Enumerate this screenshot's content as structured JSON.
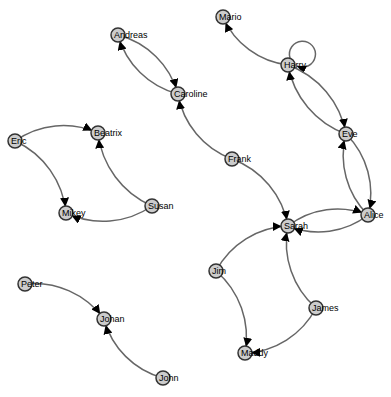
{
  "graph": {
    "type": "directed-force-graph",
    "colors": {
      "node_fill": "#cccccc",
      "node_stroke": "#333333",
      "link": "#666666",
      "arrow": "#000000",
      "background": "#ffffff"
    },
    "nodes": [
      {
        "id": "Mario",
        "x": 223,
        "y": 17
      },
      {
        "id": "Andreas",
        "x": 118,
        "y": 35
      },
      {
        "id": "Harry",
        "x": 288,
        "y": 65
      },
      {
        "id": "Caroline",
        "x": 178,
        "y": 94
      },
      {
        "id": "Eric",
        "x": 15,
        "y": 141
      },
      {
        "id": "Beatrix",
        "x": 98,
        "y": 133
      },
      {
        "id": "Eve",
        "x": 346,
        "y": 134
      },
      {
        "id": "Frank",
        "x": 232,
        "y": 159
      },
      {
        "id": "Susan",
        "x": 152,
        "y": 206
      },
      {
        "id": "Mikey",
        "x": 66,
        "y": 213
      },
      {
        "id": "Alice",
        "x": 368,
        "y": 215
      },
      {
        "id": "Sarah",
        "x": 288,
        "y": 226
      },
      {
        "id": "Jim",
        "x": 216,
        "y": 271
      },
      {
        "id": "Peter",
        "x": 25,
        "y": 284
      },
      {
        "id": "James",
        "x": 316,
        "y": 308
      },
      {
        "id": "Johan",
        "x": 104,
        "y": 319
      },
      {
        "id": "Maddy",
        "x": 245,
        "y": 353
      },
      {
        "id": "John",
        "x": 163,
        "y": 378
      }
    ],
    "links": [
      {
        "source": "Andreas",
        "target": "Caroline"
      },
      {
        "source": "Caroline",
        "target": "Andreas"
      },
      {
        "source": "Frank",
        "target": "Caroline"
      },
      {
        "source": "Frank",
        "target": "Sarah"
      },
      {
        "source": "Harry",
        "target": "Mario"
      },
      {
        "source": "Harry",
        "target": "Harry"
      },
      {
        "source": "Harry",
        "target": "Eve"
      },
      {
        "source": "Eve",
        "target": "Harry"
      },
      {
        "source": "Eve",
        "target": "Alice"
      },
      {
        "source": "Alice",
        "target": "Eve"
      },
      {
        "source": "Sarah",
        "target": "Alice"
      },
      {
        "source": "Alice",
        "target": "Sarah"
      },
      {
        "source": "Eric",
        "target": "Beatrix"
      },
      {
        "source": "Eric",
        "target": "Mikey"
      },
      {
        "source": "Susan",
        "target": "Beatrix"
      },
      {
        "source": "Susan",
        "target": "Mikey"
      },
      {
        "source": "Jim",
        "target": "Sarah"
      },
      {
        "source": "Jim",
        "target": "Maddy"
      },
      {
        "source": "James",
        "target": "Sarah"
      },
      {
        "source": "James",
        "target": "Maddy"
      },
      {
        "source": "Peter",
        "target": "Johan"
      },
      {
        "source": "John",
        "target": "Johan"
      }
    ]
  }
}
